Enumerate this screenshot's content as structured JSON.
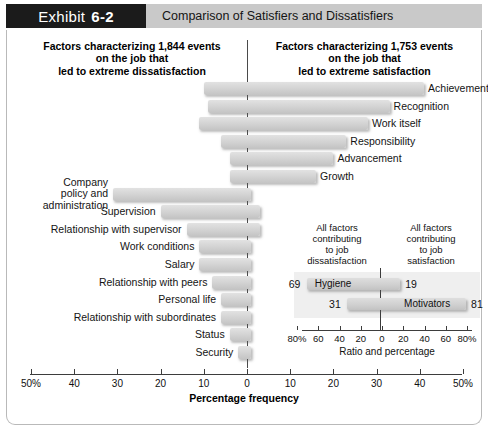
{
  "header": {
    "tab_word": "Exhibit",
    "tab_number": "6-2",
    "title": "Comparison of Satisfiers and Dissatisfiers"
  },
  "columns": {
    "left_title": "Factors characterizing 1,844 events\non the job that\nled to extreme dissatisfaction",
    "right_title": "Factors characterizing 1,753 events\non the job that\nled to extreme satisfaction"
  },
  "axis": {
    "title": "Percentage frequency",
    "tick_labels": [
      "50%",
      "40",
      "30",
      "20",
      "10",
      "0",
      "10",
      "20",
      "30",
      "40",
      "50%"
    ],
    "tick_values": [
      -50,
      -40,
      -30,
      -20,
      -10,
      0,
      10,
      20,
      30,
      40,
      50
    ],
    "min": -50,
    "max": 50
  },
  "inset": {
    "head_left": "All factors\ncontributing\nto job\ndissatisfaction",
    "head_right": "All factors\ncontributing\nto job\nsatisfaction",
    "axis_title": "Ratio and percentage",
    "tick_labels": [
      "80%",
      "60",
      "40",
      "20",
      "0",
      "20",
      "40",
      "60",
      "80%"
    ],
    "tick_values": [
      -80,
      -60,
      -40,
      -20,
      0,
      20,
      40,
      60,
      80
    ],
    "rows": [
      {
        "label": "Hygiene",
        "left_value": "69",
        "right_value": "19",
        "left": 69,
        "right": 19
      },
      {
        "label": "Motivators",
        "left_value": "31",
        "right_value": "81",
        "left": 31,
        "right": 81
      }
    ]
  },
  "chart_data": {
    "type": "bar",
    "title": "Comparison of Satisfiers and Dissatisfiers",
    "subtitle": "Factors characterizing 1,844 events on the job that led to extreme dissatisfaction vs. Factors characterizing 1,753 events on the job that led to extreme satisfaction",
    "xlabel": "Percentage frequency",
    "ylabel": "",
    "xlim": [
      -50,
      50
    ],
    "grid": false,
    "legend": "none",
    "orientation": "horizontal",
    "note": "Each bar spans from a negative (dissatisfaction) percentage to a positive (satisfaction) percentage about the 0 line.",
    "categories": [
      "Achievement",
      "Recognition",
      "Work itself",
      "Responsibility",
      "Advancement",
      "Growth",
      "Company policy and administration",
      "Supervision",
      "Relationship with supervisor",
      "Work conditions",
      "Salary",
      "Relationship with peers",
      "Personal life",
      "Relationship with subordinates",
      "Status",
      "Security"
    ],
    "series": [
      {
        "name": "Dissatisfaction side (% frequency, left of zero)",
        "values": [
          -10,
          -9,
          -11,
          -6,
          -4,
          -4,
          -31,
          -20,
          -14,
          -11,
          -11,
          -8,
          -6,
          -6,
          -4,
          -2
        ]
      },
      {
        "name": "Satisfaction side (% frequency, right of zero)",
        "values": [
          41,
          33,
          28,
          23,
          20,
          16,
          1,
          3,
          3,
          1,
          1,
          1,
          1,
          1,
          1,
          1
        ]
      }
    ],
    "bars": [
      {
        "label": "Achievement",
        "from": -10,
        "to": 41,
        "label_side": "right"
      },
      {
        "label": "Recognition",
        "from": -9,
        "to": 33,
        "label_side": "right"
      },
      {
        "label": "Work itself",
        "from": -11,
        "to": 28,
        "label_side": "right"
      },
      {
        "label": "Responsibility",
        "from": -6,
        "to": 23,
        "label_side": "right"
      },
      {
        "label": "Advancement",
        "from": -4,
        "to": 20,
        "label_side": "right"
      },
      {
        "label": "Growth",
        "from": -4,
        "to": 16,
        "label_side": "right"
      },
      {
        "label": "Company policy and administration",
        "from": -31,
        "to": 1,
        "label_side": "left"
      },
      {
        "label": "Supervision",
        "from": -20,
        "to": 3,
        "label_side": "left"
      },
      {
        "label": "Relationship with supervisor",
        "from": -14,
        "to": 3,
        "label_side": "left"
      },
      {
        "label": "Work conditions",
        "from": -11,
        "to": 1,
        "label_side": "left"
      },
      {
        "label": "Salary",
        "from": -11,
        "to": 1,
        "label_side": "left"
      },
      {
        "label": "Relationship with peers",
        "from": -8,
        "to": 1,
        "label_side": "left"
      },
      {
        "label": "Personal life",
        "from": -6,
        "to": 1,
        "label_side": "left"
      },
      {
        "label": "Relationship with subordinates",
        "from": -6,
        "to": 1,
        "label_side": "left"
      },
      {
        "label": "Status",
        "from": -4,
        "to": 1,
        "label_side": "left"
      },
      {
        "label": "Security",
        "from": -2,
        "to": 1,
        "label_side": "left"
      }
    ],
    "inset_chart": {
      "type": "bar",
      "title": "Ratio and percentage",
      "xlim": [
        -80,
        80
      ],
      "categories": [
        "Hygiene",
        "Motivators"
      ],
      "series": [
        {
          "name": "Contributing to job dissatisfaction",
          "values": [
            69,
            31
          ]
        },
        {
          "name": "Contributing to job satisfaction",
          "values": [
            19,
            81
          ]
        }
      ]
    }
  }
}
